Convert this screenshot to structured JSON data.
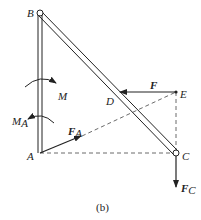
{
  "figure": {
    "caption": "(b)",
    "points": {
      "A": {
        "label": "A"
      },
      "B": {
        "label": "B"
      },
      "C": {
        "label": "C"
      },
      "D": {
        "label": "D"
      },
      "E": {
        "label": "E"
      }
    },
    "forces": {
      "F": {
        "label": "F"
      },
      "FA": {
        "label": "F",
        "sub": "A"
      },
      "FC": {
        "label": "F",
        "sub": "C"
      }
    },
    "moments": {
      "M": {
        "label": "M"
      },
      "MA": {
        "label": "M",
        "sub": "A"
      }
    },
    "colors": {
      "line": "#222222",
      "dashed": "#444444"
    }
  }
}
